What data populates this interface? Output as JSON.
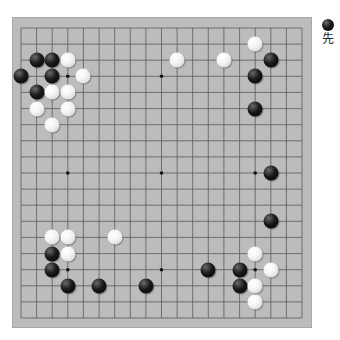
{
  "board": {
    "size": 19,
    "background_color": "#bcbcbc",
    "line_color": "#5a5a5a",
    "star_points": [
      [
        3,
        3
      ],
      [
        9,
        3
      ],
      [
        15,
        3
      ],
      [
        3,
        9
      ],
      [
        9,
        9
      ],
      [
        15,
        9
      ],
      [
        3,
        15
      ],
      [
        9,
        15
      ],
      [
        15,
        15
      ]
    ],
    "stones": [
      {
        "color": "black",
        "col": 1,
        "row": 2
      },
      {
        "color": "black",
        "col": 2,
        "row": 2
      },
      {
        "color": "white",
        "col": 3,
        "row": 2
      },
      {
        "color": "black",
        "col": 0,
        "row": 3
      },
      {
        "color": "black",
        "col": 2,
        "row": 3
      },
      {
        "color": "white",
        "col": 4,
        "row": 3
      },
      {
        "color": "black",
        "col": 1,
        "row": 4
      },
      {
        "color": "white",
        "col": 2,
        "row": 4
      },
      {
        "color": "white",
        "col": 3,
        "row": 4
      },
      {
        "color": "white",
        "col": 1,
        "row": 5
      },
      {
        "color": "white",
        "col": 3,
        "row": 5
      },
      {
        "color": "white",
        "col": 2,
        "row": 6
      },
      {
        "color": "white",
        "col": 10,
        "row": 2
      },
      {
        "color": "white",
        "col": 13,
        "row": 2
      },
      {
        "color": "white",
        "col": 15,
        "row": 1
      },
      {
        "color": "black",
        "col": 16,
        "row": 2
      },
      {
        "color": "black",
        "col": 15,
        "row": 3
      },
      {
        "color": "black",
        "col": 15,
        "row": 5
      },
      {
        "color": "black",
        "col": 16,
        "row": 9
      },
      {
        "color": "black",
        "col": 16,
        "row": 12
      },
      {
        "color": "white",
        "col": 2,
        "row": 13
      },
      {
        "color": "white",
        "col": 3,
        "row": 13
      },
      {
        "color": "white",
        "col": 6,
        "row": 13
      },
      {
        "color": "black",
        "col": 2,
        "row": 14
      },
      {
        "color": "white",
        "col": 3,
        "row": 14
      },
      {
        "color": "black",
        "col": 2,
        "row": 15
      },
      {
        "color": "black",
        "col": 3,
        "row": 16
      },
      {
        "color": "black",
        "col": 5,
        "row": 16
      },
      {
        "color": "black",
        "col": 8,
        "row": 16
      },
      {
        "color": "white",
        "col": 15,
        "row": 14
      },
      {
        "color": "black",
        "col": 12,
        "row": 15
      },
      {
        "color": "black",
        "col": 14,
        "row": 15
      },
      {
        "color": "white",
        "col": 16,
        "row": 15
      },
      {
        "color": "black",
        "col": 14,
        "row": 16
      },
      {
        "color": "white",
        "col": 15,
        "row": 16
      },
      {
        "color": "white",
        "col": 15,
        "row": 17
      }
    ]
  },
  "turn_indicator": {
    "stone_color": "black",
    "label": "先"
  }
}
